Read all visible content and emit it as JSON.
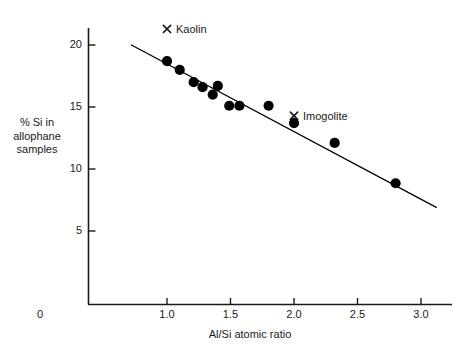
{
  "chart_data": {
    "type": "scatter",
    "title": "",
    "xlabel": "Al/Si atomic ratio",
    "ylabel": "% Si in\nallophane\nsamples",
    "xlim": [
      0,
      3.2
    ],
    "ylim": [
      0,
      22.5
    ],
    "grid": false,
    "legend": "none",
    "xticks": [
      {
        "value": 0,
        "label": "0"
      },
      {
        "value": 1.0,
        "label": "1.0"
      },
      {
        "value": 1.5,
        "label": "1.5"
      },
      {
        "value": 2.0,
        "label": "2.0"
      },
      {
        "value": 2.5,
        "label": "2.5"
      },
      {
        "value": 3.0,
        "label": "3.0"
      }
    ],
    "yticks": [
      {
        "value": 5,
        "label": "5"
      },
      {
        "value": 10,
        "label": "10"
      },
      {
        "value": 15,
        "label": "15"
      },
      {
        "value": 20,
        "label": "20"
      }
    ],
    "series": [
      {
        "name": "allophane samples",
        "marker": "filled-circle",
        "color": "#000000",
        "points": [
          {
            "x": 1.0,
            "y": 18.7
          },
          {
            "x": 1.1,
            "y": 18.0
          },
          {
            "x": 1.21,
            "y": 17.0
          },
          {
            "x": 1.28,
            "y": 16.6
          },
          {
            "x": 1.36,
            "y": 16.0
          },
          {
            "x": 1.4,
            "y": 16.7
          },
          {
            "x": 1.49,
            "y": 15.1
          },
          {
            "x": 1.57,
            "y": 15.1
          },
          {
            "x": 1.8,
            "y": 15.1
          },
          {
            "x": 2.0,
            "y": 13.7
          },
          {
            "x": 2.32,
            "y": 12.1
          },
          {
            "x": 2.8,
            "y": 8.85
          }
        ]
      }
    ],
    "trendline": {
      "name": "fitted line",
      "color": "#000000",
      "x0": 0.72,
      "y0": 20.0,
      "x1": 3.12,
      "y1": 6.9
    },
    "annotations": [
      {
        "name": "Kaolin",
        "label": "Kaolin",
        "marker": "x-cross",
        "x": 1.0,
        "y": 21.3,
        "label_dx": 9,
        "label_dy": -6
      },
      {
        "name": "Imogolite",
        "label": "Imogolite",
        "marker": "x-cross",
        "x": 2.0,
        "y": 14.3,
        "label_dx": 9,
        "label_dy": -6
      }
    ]
  },
  "axes": {
    "x_label": "Al/Si atomic ratio",
    "y_label_line1": "% Si in",
    "y_label_line2": "allophane",
    "y_label_line3": "samples",
    "x_tick_0": "0",
    "x_tick_1": "1.0",
    "x_tick_2": "1.5",
    "x_tick_3": "2.0",
    "x_tick_4": "2.5",
    "x_tick_5": "3.0",
    "y_tick_0": "5",
    "y_tick_1": "10",
    "y_tick_2": "15",
    "y_tick_3": "20"
  },
  "annotations": {
    "kaolin_label": "Kaolin",
    "imogolite_label": "Imogolite"
  },
  "colors": {
    "axis": "#1a1a1a",
    "marker": "#000000",
    "line": "#1a1a1a",
    "background": "#ffffff"
  }
}
